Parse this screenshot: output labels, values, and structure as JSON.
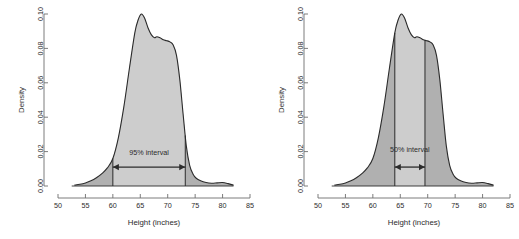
{
  "figure": {
    "background": "#ffffff",
    "panel_count": 2
  },
  "style": {
    "curve_stroke": "#2b2b2b",
    "fill_outer": "#b0b0b0",
    "fill_inner": "#cdcdcd",
    "axis_color": "#6e6e6e",
    "text_color": "#2b2b2b"
  },
  "chart_data": [
    {
      "type": "area",
      "title": "",
      "xlabel": "Height (inches)",
      "ylabel": "Density",
      "xlim": [
        50,
        85
      ],
      "ylim": [
        0.0,
        0.1
      ],
      "xticks": [
        50,
        55,
        60,
        65,
        70,
        75,
        80,
        85
      ],
      "xticklabels": [
        "50",
        "55",
        "60",
        "65",
        "70",
        "75",
        "80",
        "85"
      ],
      "yticks": [
        0.0,
        0.02,
        0.04,
        0.06,
        0.08,
        0.1
      ],
      "yticklabels": [
        "0.00",
        "0.02",
        "0.04",
        "0.06",
        "0.08",
        "0.10"
      ],
      "grid": false,
      "legend": null,
      "annotation": {
        "label": "95% interval",
        "lower": 60.0,
        "upper": 73.2,
        "arrow_y": 0.011,
        "label_y": 0.018,
        "shaded_between": true
      },
      "x": [
        53.0,
        54.0,
        55.0,
        56.0,
        57.0,
        58.0,
        59.0,
        60.0,
        61.0,
        62.0,
        63.0,
        64.0,
        64.6,
        65.2,
        65.8,
        66.4,
        67.0,
        67.6,
        68.0,
        68.6,
        69.2,
        69.8,
        70.4,
        71.0,
        71.6,
        72.2,
        72.8,
        73.4,
        74.0,
        74.6,
        75.2,
        76.0,
        77.0,
        78.0,
        79.0,
        80.0,
        81.0,
        82.0
      ],
      "y": [
        0.0005,
        0.001,
        0.0018,
        0.003,
        0.0048,
        0.0072,
        0.0105,
        0.016,
        0.028,
        0.046,
        0.068,
        0.089,
        0.0965,
        0.1,
        0.0975,
        0.092,
        0.088,
        0.0862,
        0.0868,
        0.0862,
        0.085,
        0.0845,
        0.0838,
        0.082,
        0.076,
        0.062,
        0.042,
        0.023,
        0.012,
        0.007,
        0.0045,
        0.003,
        0.002,
        0.0016,
        0.0018,
        0.002,
        0.0014,
        0.0005
      ]
    },
    {
      "type": "area",
      "title": "",
      "xlabel": "Height (inches)",
      "ylabel": "Density",
      "xlim": [
        50,
        85
      ],
      "ylim": [
        0.0,
        0.1
      ],
      "xticks": [
        50,
        55,
        60,
        65,
        70,
        75,
        80,
        85
      ],
      "xticklabels": [
        "50",
        "55",
        "60",
        "65",
        "70",
        "75",
        "80",
        "85"
      ],
      "yticks": [
        0.0,
        0.02,
        0.04,
        0.06,
        0.08,
        0.1
      ],
      "yticklabels": [
        "0.00",
        "0.02",
        "0.04",
        "0.06",
        "0.08",
        "0.10"
      ],
      "grid": false,
      "legend": null,
      "annotation": {
        "label": "50% interval",
        "lower": 64.0,
        "upper": 69.5,
        "arrow_y": 0.011,
        "label_y": 0.02,
        "shaded_between": true
      },
      "x": [
        53.0,
        54.0,
        55.0,
        56.0,
        57.0,
        58.0,
        59.0,
        60.0,
        61.0,
        62.0,
        63.0,
        64.0,
        64.6,
        65.2,
        65.8,
        66.4,
        67.0,
        67.6,
        68.0,
        68.6,
        69.2,
        69.8,
        70.4,
        71.0,
        71.6,
        72.2,
        72.8,
        73.4,
        74.0,
        74.6,
        75.2,
        76.0,
        77.0,
        78.0,
        79.0,
        80.0,
        81.0,
        82.0
      ],
      "y": [
        0.0005,
        0.001,
        0.0018,
        0.003,
        0.0048,
        0.0072,
        0.0105,
        0.016,
        0.028,
        0.046,
        0.068,
        0.089,
        0.0965,
        0.1,
        0.0975,
        0.092,
        0.088,
        0.0862,
        0.0868,
        0.0862,
        0.085,
        0.0845,
        0.0838,
        0.082,
        0.076,
        0.062,
        0.042,
        0.023,
        0.012,
        0.007,
        0.0045,
        0.003,
        0.002,
        0.0016,
        0.0018,
        0.002,
        0.0014,
        0.0005
      ]
    }
  ]
}
